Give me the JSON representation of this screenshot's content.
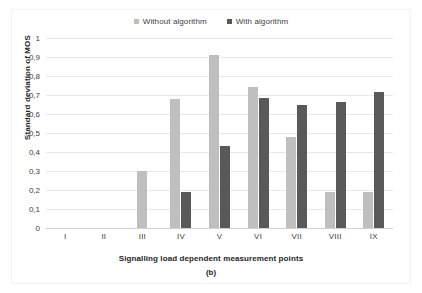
{
  "chart_data": {
    "type": "bar",
    "title": "",
    "subtitle": "",
    "categories": [
      "I",
      "II",
      "III",
      "IV",
      "V",
      "VI",
      "VII",
      "VIII",
      "IX"
    ],
    "series": [
      {
        "name": "Without algorithm",
        "color": "#bfbfbf",
        "values": [
          0,
          0,
          0.3,
          0.68,
          0.91,
          0.74,
          0.48,
          0.19,
          0.19
        ]
      },
      {
        "name": "With algorithm",
        "color": "#595959",
        "values": [
          0,
          0,
          0,
          0.19,
          0.43,
          0.685,
          0.65,
          0.665,
          0.715
        ]
      }
    ],
    "xlabel": "Signalling load dependent measurement points",
    "ylabel": "Standard deviation of MOS",
    "ylim": [
      0,
      1
    ],
    "ytick_values": [
      0,
      0.1,
      0.2,
      0.3,
      0.4,
      0.5,
      0.6,
      0.7,
      0.8,
      0.9,
      1
    ],
    "ytick_labels": [
      "0",
      "0,1",
      "0,2",
      "0,3",
      "0,4",
      "0,5",
      "0,6",
      "0,7",
      "0,8",
      "0,9",
      "1"
    ],
    "grid": true,
    "grid_axis": "y",
    "legend_position": "top-center",
    "decimal_separator": ",",
    "caption": "(b)"
  },
  "legend": {
    "entries": [
      {
        "label": "Without algorithm",
        "color": "#bfbfbf"
      },
      {
        "label": "With algorithm",
        "color": "#595959"
      }
    ]
  },
  "axes": {
    "y_title": "Standard deviation of MOS",
    "x_title": "Signalling load dependent measurement points"
  },
  "caption": "(b)"
}
